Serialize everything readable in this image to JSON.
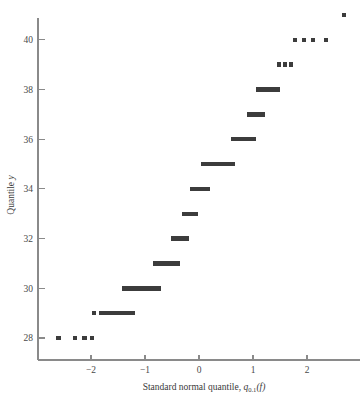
{
  "chart_data": {
    "type": "scatter",
    "title": "",
    "subtitle": "",
    "xlabel": "Standard normal quantile, q0.1(f)",
    "xlabel_parts": {
      "lead": "Standard normal quantile, ",
      "symbol": "q",
      "subscript": "0.1",
      "argument": "(f)"
    },
    "ylabel": "Quantile y",
    "ylabel_parts": {
      "lead": "Quantile ",
      "variable": "y"
    },
    "xlim": [
      -2.95,
      3.05
    ],
    "ylim": [
      27.1,
      41.6
    ],
    "xticks": [
      -2,
      -1,
      0,
      1,
      2
    ],
    "xticklabels": [
      "−2",
      "−1",
      "0",
      "1",
      "2"
    ],
    "yticks": [
      28,
      30,
      32,
      34,
      36,
      38,
      40
    ],
    "yticklabels": [
      "28",
      "30",
      "32",
      "34",
      "36",
      "38",
      "40"
    ],
    "grid": false,
    "legend": false,
    "legend_position": "none",
    "marker_color": "#3c3c3c",
    "axis_color": "#8a8a8a",
    "marker_size_px": 4.4,
    "note": "Quantile-quantile plot; horizontal runs are many tied observations drawn as adjacent markers.",
    "rows": [
      {
        "y": 28,
        "points": [
          -2.6,
          -2.3,
          -2.12,
          -1.98
        ]
      },
      {
        "y": 29,
        "points": [
          -1.94
        ],
        "runs": [
          [
            -1.82,
            -1.23
          ]
        ]
      },
      {
        "y": 30,
        "points": [],
        "runs": [
          [
            -1.39,
            -0.74
          ]
        ]
      },
      {
        "y": 31,
        "points": [],
        "runs": [
          [
            -0.81,
            -0.39
          ]
        ]
      },
      {
        "y": 32,
        "points": [],
        "runs": [
          [
            -0.48,
            -0.22
          ]
        ]
      },
      {
        "y": 33,
        "points": [],
        "runs": [
          [
            -0.28,
            -0.06
          ]
        ]
      },
      {
        "y": 34,
        "points": [],
        "runs": [
          [
            -0.13,
            0.17
          ]
        ]
      },
      {
        "y": 35,
        "points": [],
        "runs": [
          [
            0.07,
            0.63
          ]
        ]
      },
      {
        "y": 36,
        "points": [],
        "runs": [
          [
            0.63,
            1.02
          ]
        ]
      },
      {
        "y": 37,
        "points": [],
        "runs": [
          [
            0.93,
            1.19
          ]
        ]
      },
      {
        "y": 38,
        "points": [],
        "runs": [
          [
            1.09,
            1.46
          ]
        ]
      },
      {
        "y": 39,
        "points": [
          1.48,
          1.59,
          1.7
        ]
      },
      {
        "y": 40,
        "points": [
          1.78,
          1.94,
          2.11,
          2.35
        ]
      },
      {
        "y": 41,
        "points": [
          2.69
        ]
      }
    ]
  }
}
